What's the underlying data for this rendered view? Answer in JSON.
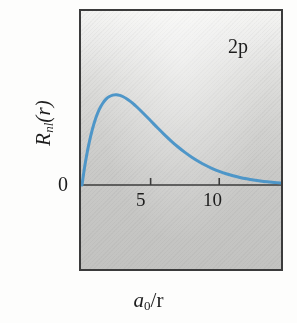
{
  "figure": {
    "series_label": "2p",
    "ylabel_main": "R",
    "ylabel_sub": "nl",
    "ylabel_arg": "(r)",
    "xlabel_main": "a",
    "xlabel_sub": "0",
    "xlabel_rest": "/r",
    "ytick_zero": "0",
    "xtick_5": "5",
    "xtick_10": "10",
    "curve_color": "#4e96c8",
    "frame_color": "#3b3b3b",
    "plot_bg_top": "#f4f4f2",
    "plot_bg_bottom": "#c3c3c1",
    "page_bg": "#fdfdfc",
    "text_color": "#1d1d1d"
  },
  "chart_data": {
    "type": "line",
    "title": "",
    "subtitle": "",
    "xlabel": "a_0/r",
    "ylabel": "R_nl(r)",
    "annotations": [
      "2p"
    ],
    "legend": [],
    "legend_position": "none",
    "grid": false,
    "xlim": [
      0,
      14.5
    ],
    "ylim": [
      0,
      0.22
    ],
    "xticks": [
      5,
      10
    ],
    "xticklabels": [
      "5",
      "10"
    ],
    "yticks": [
      0
    ],
    "yticklabels": [
      "0"
    ],
    "series": [
      {
        "name": "2p",
        "color": "#4e96c8",
        "linewidth": 3,
        "x": [
          0,
          0.15,
          0.3,
          0.5,
          0.75,
          1.0,
          1.25,
          1.5,
          1.75,
          2.0,
          2.25,
          2.5,
          2.75,
          3.0,
          3.25,
          3.5,
          3.75,
          4.0,
          4.5,
          5.0,
          5.5,
          6.0,
          6.5,
          7.0,
          7.5,
          8.0,
          8.5,
          9.0,
          9.5,
          10.0,
          10.5,
          11.0,
          11.5,
          12.0,
          12.5,
          13.0,
          13.5,
          14.0,
          14.5
        ],
        "y": [
          0.0,
          0.0205,
          0.0382,
          0.0584,
          0.0792,
          0.0954,
          0.1076,
          0.1165,
          0.1226,
          0.1264,
          0.1284,
          0.1288,
          0.128,
          0.1261,
          0.1233,
          0.1198,
          0.1158,
          0.1114,
          0.1018,
          0.0918,
          0.0817,
          0.072,
          0.0628,
          0.0543,
          0.0466,
          0.0397,
          0.0336,
          0.0282,
          0.0235,
          0.0195,
          0.0161,
          0.0132,
          0.0108,
          0.0088,
          0.0071,
          0.0057,
          0.0046,
          0.0037,
          0.0029
        ]
      }
    ]
  }
}
